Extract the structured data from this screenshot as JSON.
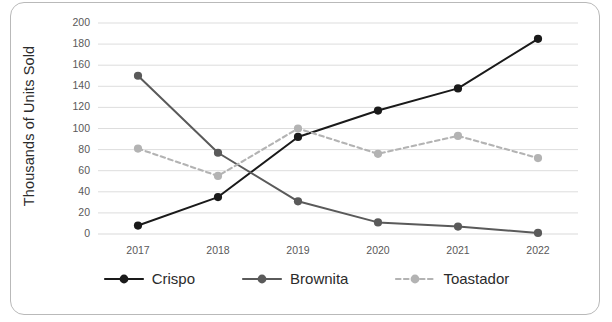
{
  "chart_data": {
    "type": "line",
    "title": "",
    "subtitle": "",
    "xlabel": "",
    "ylabel": "Thousands of Units Sold",
    "categories": [
      "2017",
      "2018",
      "2019",
      "2020",
      "2021",
      "2022"
    ],
    "x": [
      2017,
      2018,
      2019,
      2020,
      2021,
      2022
    ],
    "ylim": [
      0,
      200
    ],
    "ytick_step": 20,
    "yticks": [
      "200",
      "180",
      "160",
      "140",
      "120",
      "100",
      "80",
      "60",
      "40",
      "20",
      "0"
    ],
    "grid": "horizontal",
    "legend_position": "bottom",
    "series": [
      {
        "name": "Crispo",
        "values": [
          8,
          35,
          92,
          117,
          138,
          185
        ],
        "color": "#1a1a1a",
        "style": "solid",
        "marker": "circle"
      },
      {
        "name": "Brownita",
        "values": [
          150,
          77,
          31,
          11,
          7,
          1
        ],
        "color": "#5a5a5a",
        "style": "solid",
        "marker": "circle"
      },
      {
        "name": "Toastador",
        "values": [
          81,
          55,
          100,
          76,
          93,
          72
        ],
        "color": "#b3b3b3",
        "style": "dashed",
        "marker": "circle"
      }
    ],
    "gridline_color": "#d9d9d9",
    "frame_color": "#b9b9b9",
    "background": "#ffffff"
  },
  "legend": {
    "items": [
      {
        "label": "Crispo"
      },
      {
        "label": "Brownita"
      },
      {
        "label": "Toastador"
      }
    ]
  }
}
